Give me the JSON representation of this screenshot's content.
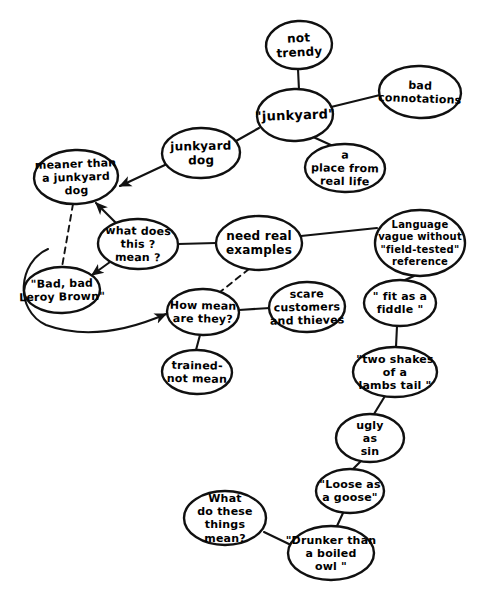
{
  "diagram": {
    "type": "concept-map",
    "style": "hand-drawn",
    "title_fragment": "",
    "canvas": {
      "width": 482,
      "height": 594
    },
    "colors": {
      "background": "#ffffff",
      "ink": "#101010",
      "edge": "#121212"
    },
    "nodes": [
      {
        "id": "not-trendy",
        "lines": [
          "not",
          "trendy"
        ],
        "cx": 299,
        "cy": 45,
        "rx": 33,
        "ry": 24,
        "rot": -3,
        "fs": 12
      },
      {
        "id": "bad-connotations",
        "lines": [
          "bad",
          "connotations"
        ],
        "cx": 420,
        "cy": 92,
        "rx": 41,
        "ry": 26,
        "rot": 2,
        "fs": 11
      },
      {
        "id": "junkyard",
        "lines": [
          "\"junkyard\""
        ],
        "cx": 295,
        "cy": 115,
        "rx": 38,
        "ry": 26,
        "rot": -2,
        "fs": 13
      },
      {
        "id": "a-place-from-real-life",
        "lines": [
          "a",
          "place from",
          "real life"
        ],
        "cx": 345,
        "cy": 168,
        "rx": 40,
        "ry": 24,
        "rot": 1,
        "fs": 11
      },
      {
        "id": "junkyard-dog",
        "lines": [
          "junkyard",
          "dog"
        ],
        "cx": 201,
        "cy": 153,
        "rx": 39,
        "ry": 25,
        "rot": -1,
        "fs": 12
      },
      {
        "id": "meaner-than-a-junkyard-dog",
        "lines": [
          "meaner than",
          "a  junkyard",
          "dog"
        ],
        "cx": 76,
        "cy": 177,
        "rx": 42,
        "ry": 27,
        "rot": -2,
        "fs": 11
      },
      {
        "id": "what-does-this-mean",
        "lines": [
          "what does",
          "this ?",
          "mean ?"
        ],
        "cx": 138,
        "cy": 244,
        "rx": 40,
        "ry": 25,
        "rot": 1,
        "fs": 11
      },
      {
        "id": "bad-bad-leroy-brown",
        "lines": [
          "\"Bad, bad",
          "Leroy Brown\""
        ],
        "cx": 62,
        "cy": 290,
        "rx": 38,
        "ry": 23,
        "rot": -1,
        "fs": 11
      },
      {
        "id": "need-real-examples",
        "lines": [
          "need real",
          "examples"
        ],
        "cx": 259,
        "cy": 243,
        "rx": 43,
        "ry": 27,
        "rot": 0,
        "fs": 12
      },
      {
        "id": "how-mean-are-they",
        "lines": [
          "How mean",
          "are they?"
        ],
        "cx": 203,
        "cy": 312,
        "rx": 36,
        "ry": 23,
        "rot": 1,
        "fs": 11
      },
      {
        "id": "scare-customers-and-thieves",
        "lines": [
          "scare",
          "customers",
          "and thieves"
        ],
        "cx": 307,
        "cy": 307,
        "rx": 38,
        "ry": 25,
        "rot": -1,
        "fs": 11
      },
      {
        "id": "trained-not-mean",
        "lines": [
          "trained-",
          "not mean"
        ],
        "cx": 197,
        "cy": 372,
        "rx": 35,
        "ry": 22,
        "rot": 1,
        "fs": 11
      },
      {
        "id": "language-vague-without-field-tested-reference",
        "lines": [
          "Language",
          "vague without",
          "\"field-tested\"",
          "reference"
        ],
        "cx": 420,
        "cy": 243,
        "rx": 45,
        "ry": 33,
        "rot": 0,
        "fs": 10
      },
      {
        "id": "fit-as-a-fiddle",
        "lines": [
          "\" fit as a",
          "fiddle \""
        ],
        "cx": 400,
        "cy": 303,
        "rx": 36,
        "ry": 23,
        "rot": 0,
        "fs": 11
      },
      {
        "id": "two-shakes-of-a-lambs-tail",
        "lines": [
          "\"two shakes",
          "of a",
          "lambs tail \""
        ],
        "cx": 395,
        "cy": 372,
        "rx": 42,
        "ry": 25,
        "rot": 0,
        "fs": 11
      },
      {
        "id": "ugly-as-sin",
        "lines": [
          "ugly",
          "as",
          "sin"
        ],
        "cx": 370,
        "cy": 438,
        "rx": 34,
        "ry": 24,
        "rot": 0,
        "fs": 11
      },
      {
        "id": "loose-as-a-goose",
        "lines": [
          "\"Loose as",
          "a goose\""
        ],
        "cx": 350,
        "cy": 491,
        "rx": 34,
        "ry": 22,
        "rot": 0,
        "fs": 11
      },
      {
        "id": "drunker-than-a-boiled-owl",
        "lines": [
          "\"Drunker than",
          "a boiled",
          "owl \""
        ],
        "cx": 331,
        "cy": 553,
        "rx": 43,
        "ry": 27,
        "rot": 0,
        "fs": 11
      },
      {
        "id": "what-do-these-things-mean",
        "lines": [
          "What",
          "do  these",
          "things",
          "mean?"
        ],
        "cx": 225,
        "cy": 518,
        "rx": 41,
        "ry": 27,
        "rot": 0,
        "fs": 11
      }
    ],
    "edges": [
      {
        "id": "junkyard--not-trendy",
        "from": "junkyard",
        "to": "not-trendy",
        "kind": "plain",
        "path": "M 299,90 L 298,69"
      },
      {
        "id": "junkyard--bad-connotations",
        "from": "junkyard",
        "to": "bad-connotations",
        "kind": "plain",
        "path": "M 331,107 L 380,95"
      },
      {
        "id": "junkyard--a-place-from-real-life",
        "from": "junkyard",
        "to": "a-place-from-real-life",
        "kind": "plain",
        "path": "M 311,136 L 333,146"
      },
      {
        "id": "junkyard--junkyard-dog",
        "from": "junkyard",
        "to": "junkyard-dog",
        "kind": "plain",
        "path": "M 259,128 L 236,141"
      },
      {
        "id": "junkyard-dog--meaner-than",
        "from": "junkyard-dog",
        "to": "meaner-than-a-junkyard-dog",
        "kind": "arrow",
        "path": "M 167,164 L 120,186"
      },
      {
        "id": "what-does-this-mean--meaner-than",
        "from": "what-does-this-mean",
        "to": "meaner-than-a-junkyard-dog",
        "kind": "arrow",
        "path": "M 117,224 L 96,203"
      },
      {
        "id": "what-does-this-mean--leroy-brown",
        "from": "what-does-this-mean",
        "to": "bad-bad-leroy-brown",
        "kind": "arrow",
        "path": "M 110,262 L 92,275"
      },
      {
        "id": "meaner-than--leroy-brown",
        "from": "meaner-than-a-junkyard-dog",
        "to": "bad-bad-leroy-brown",
        "kind": "dashed",
        "path": "M 73,204 L 62,267"
      },
      {
        "id": "leroy-brown--how-mean-are-they",
        "from": "bad-bad-leroy-brown",
        "to": "how-mean-are-they",
        "kind": "arrow",
        "path": "M 48,249 C 18,262 14,310 46,325 C 90,341 136,327 166,314"
      },
      {
        "id": "what-does-this-mean--need-real-examples",
        "from": "what-does-this-mean",
        "to": "need-real-examples",
        "kind": "plain",
        "path": "M 178,244 L 216,243"
      },
      {
        "id": "need-real-examples--language-vague",
        "from": "need-real-examples",
        "to": "language-vague-without-field-tested-reference",
        "kind": "plain",
        "path": "M 301,236 L 377,228"
      },
      {
        "id": "need-real-examples--how-mean-are-they",
        "from": "need-real-examples",
        "to": "how-mean-are-they",
        "kind": "dashed",
        "path": "M 249,269 L 220,292"
      },
      {
        "id": "how-mean-are-they--scare-customers",
        "from": "how-mean-are-they",
        "to": "scare-customers-and-thieves",
        "kind": "plain",
        "path": "M 239,310 L 270,308"
      },
      {
        "id": "how-mean-are-they--trained-not-mean",
        "from": "how-mean-are-they",
        "to": "trained-not-mean",
        "kind": "plain",
        "path": "M 200,335 L 196,350"
      },
      {
        "id": "language-vague--fit-as-a-fiddle",
        "from": "language-vague-without-field-tested-reference",
        "to": "fit-as-a-fiddle",
        "kind": "plain",
        "path": "M 414,276 L 405,280"
      },
      {
        "id": "fit-as-a-fiddle--two-shakes",
        "from": "fit-as-a-fiddle",
        "to": "two-shakes-of-a-lambs-tail",
        "kind": "plain",
        "path": "M 397,326 L 396,347"
      },
      {
        "id": "two-shakes--ugly-as-sin",
        "from": "two-shakes-of-a-lambs-tail",
        "to": "ugly-as-sin",
        "kind": "plain",
        "path": "M 385,396 L 374,414"
      },
      {
        "id": "ugly-as-sin--loose-as-a-goose",
        "from": "ugly-as-sin",
        "to": "loose-as-a-goose",
        "kind": "plain",
        "path": "M 361,461 L 353,469"
      },
      {
        "id": "loose-as-a-goose--drunker-than-owl",
        "from": "loose-as-a-goose",
        "to": "drunker-than-a-boiled-owl",
        "kind": "plain",
        "path": "M 343,513 L 337,526"
      },
      {
        "id": "what-do-these-things-mean--drunker-than-owl",
        "from": "what-do-these-things-mean",
        "to": "drunker-than-a-boiled-owl",
        "kind": "plain",
        "path": "M 264,532 L 291,545"
      }
    ]
  }
}
